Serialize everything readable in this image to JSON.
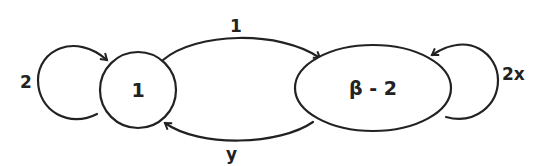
{
  "diagram": {
    "type": "state-transition-diagram",
    "nodes": [
      {
        "id": "n1",
        "label": "1"
      },
      {
        "id": "n2",
        "label": "β - 2"
      }
    ],
    "edges": [
      {
        "from": "n1",
        "to": "n1",
        "label": "2"
      },
      {
        "from": "n1",
        "to": "n2",
        "label": "1"
      },
      {
        "from": "n2",
        "to": "n1",
        "label": "y"
      },
      {
        "from": "n2",
        "to": "n2",
        "label": "2x"
      }
    ]
  }
}
